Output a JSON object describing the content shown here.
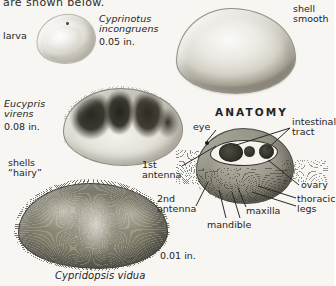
{
  "plate": {
    "top_text": "are shown below.",
    "heading": "ANATOMY",
    "background_color": "#f7f6f3",
    "ink_color": "#25241f"
  },
  "specimens": [
    {
      "id": "larva",
      "label": "larva",
      "name_lines": "",
      "size": ""
    },
    {
      "id": "cyprinotus-incongruens",
      "name_lines": "Cyprinotus\nincongruens",
      "size": "0.05 in.",
      "note": "shell\nsmooth"
    },
    {
      "id": "eucypris-virens",
      "name_lines": "Eucypris\nvirens",
      "size": "0.08 in.",
      "note": "shells\n“hairy”"
    },
    {
      "id": "cypridopsis-vidua",
      "name_lines": "Cypridopsis vidua",
      "size": "0.01 in."
    }
  ],
  "anatomy": {
    "title": "ANATOMY",
    "parts": [
      {
        "key": "eye",
        "label": "eye"
      },
      {
        "key": "intestinal-tract",
        "label": "intestinal\ntract"
      },
      {
        "key": "ovary",
        "label": "ovary"
      },
      {
        "key": "thoracic-legs",
        "label": "thoracic\nlegs"
      },
      {
        "key": "maxilla",
        "label": "maxilla"
      },
      {
        "key": "mandible",
        "label": "mandible"
      },
      {
        "key": "first-antenna",
        "label": "1st\nantenna"
      },
      {
        "key": "second-antenna",
        "label": "2nd\nantenna"
      }
    ]
  }
}
